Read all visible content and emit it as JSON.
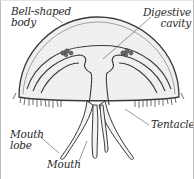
{
  "diagram": {
    "labels": {
      "bell_body": {
        "line1": "Bell-shaped",
        "line2": "body"
      },
      "digestive_cavity": {
        "line1": "Digestive",
        "line2": "cavity"
      },
      "tentacle": {
        "line1": "Tentacle"
      },
      "mouth_lobe": {
        "line1": "Mouth",
        "line2": "lobe"
      },
      "mouth": {
        "line1": "Mouth"
      }
    },
    "colors": {
      "outline": "#3a3a3a",
      "stipple_fill": "#ececec",
      "background": "#ffffff",
      "border": "#bdbdbd"
    }
  }
}
